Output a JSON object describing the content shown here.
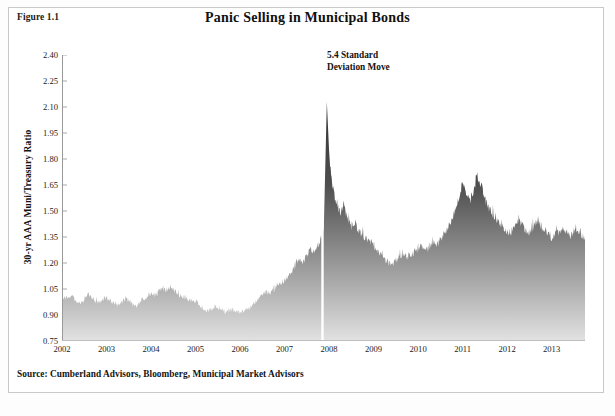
{
  "figure": {
    "label": "Figure 1.1",
    "title": "Panic Selling in Municipal Bonds",
    "source": "Source: Cumberland Advisors, Bloomberg, Municipal Market Advisors"
  },
  "annotation": {
    "line1": "5.4 Standard",
    "line2": "Deviation Move"
  },
  "axes": {
    "ylabel": "30-yr AAA Muni/Treasury Ratio",
    "yticks": [
      "2.40",
      "2.25",
      "2.10",
      "1.95",
      "1.80",
      "1.65",
      "1.50",
      "1.35",
      "1.20",
      "1.05",
      "0.90",
      "0.75"
    ],
    "xticks": [
      "2002",
      "2003",
      "2004",
      "2005",
      "2006",
      "2007",
      "2008",
      "2009",
      "2010",
      "2011",
      "2012",
      "2013"
    ]
  },
  "colors": {
    "fill_top": "#3a3a3a",
    "fill_bottom": "#d8d8d8",
    "axis": "#9a9a9a",
    "text": "#141414",
    "frame": "#c9c9c9",
    "gap_line": "#ffffff"
  },
  "chart_data": {
    "type": "area",
    "title": "Panic Selling in Municipal Bonds",
    "xlabel": "",
    "ylabel": "30-yr AAA Muni/Treasury Ratio",
    "xlim": [
      2002.0,
      2013.75
    ],
    "ylim": [
      0.75,
      2.4
    ],
    "yticks": [
      0.75,
      0.9,
      1.05,
      1.2,
      1.35,
      1.5,
      1.65,
      1.8,
      1.95,
      2.1,
      2.25,
      2.4
    ],
    "xticks": [
      2002,
      2003,
      2004,
      2005,
      2006,
      2007,
      2008,
      2009,
      2010,
      2011,
      2012,
      2013
    ],
    "grid": false,
    "legend": null,
    "annotations": [
      {
        "text": "5.4 Standard Deviation Move",
        "x": 2008.0,
        "y": 2.3
      }
    ],
    "data_gap": {
      "x": 2007.85,
      "note": "white vertical break in series just before the peak"
    },
    "peak": {
      "x": 2007.95,
      "y": 2.13
    },
    "series": [
      {
        "name": "30-yr AAA Muni/Treasury Ratio",
        "x": [
          2002.0,
          2002.08,
          2002.17,
          2002.25,
          2002.33,
          2002.42,
          2002.5,
          2002.58,
          2002.67,
          2002.75,
          2002.83,
          2002.92,
          2003.0,
          2003.08,
          2003.17,
          2003.25,
          2003.33,
          2003.42,
          2003.5,
          2003.58,
          2003.67,
          2003.75,
          2003.83,
          2003.92,
          2004.0,
          2004.08,
          2004.17,
          2004.25,
          2004.33,
          2004.42,
          2004.5,
          2004.58,
          2004.67,
          2004.75,
          2004.83,
          2004.92,
          2005.0,
          2005.08,
          2005.17,
          2005.25,
          2005.33,
          2005.42,
          2005.5,
          2005.58,
          2005.67,
          2005.75,
          2005.83,
          2005.92,
          2006.0,
          2006.08,
          2006.17,
          2006.25,
          2006.33,
          2006.42,
          2006.5,
          2006.58,
          2006.67,
          2006.75,
          2006.83,
          2006.92,
          2007.0,
          2007.08,
          2007.17,
          2007.25,
          2007.33,
          2007.42,
          2007.5,
          2007.58,
          2007.67,
          2007.75,
          2007.83,
          2007.88,
          2007.95,
          2008.0,
          2008.08,
          2008.17,
          2008.25,
          2008.33,
          2008.42,
          2008.5,
          2008.58,
          2008.67,
          2008.75,
          2008.83,
          2008.92,
          2009.0,
          2009.08,
          2009.17,
          2009.25,
          2009.33,
          2009.42,
          2009.5,
          2009.58,
          2009.67,
          2009.75,
          2009.83,
          2009.92,
          2010.0,
          2010.08,
          2010.17,
          2010.25,
          2010.33,
          2010.42,
          2010.5,
          2010.58,
          2010.67,
          2010.75,
          2010.83,
          2010.92,
          2011.0,
          2011.08,
          2011.17,
          2011.25,
          2011.33,
          2011.42,
          2011.5,
          2011.58,
          2011.67,
          2011.75,
          2011.83,
          2011.92,
          2012.0,
          2012.08,
          2012.17,
          2012.25,
          2012.33,
          2012.42,
          2012.5,
          2012.58,
          2012.67,
          2012.75,
          2012.83,
          2012.92,
          2013.0,
          2013.08,
          2013.17,
          2013.25,
          2013.33,
          2013.42,
          2013.5,
          2013.58,
          2013.67,
          2013.75
        ],
        "y": [
          0.98,
          1.0,
          0.99,
          1.01,
          0.97,
          0.96,
          0.99,
          1.02,
          1.0,
          0.98,
          0.97,
          0.99,
          1.0,
          0.98,
          0.96,
          0.95,
          0.97,
          0.99,
          0.98,
          0.96,
          0.95,
          0.97,
          0.99,
          1.0,
          1.02,
          1.01,
          1.03,
          1.05,
          1.04,
          1.06,
          1.04,
          1.02,
          1.01,
          1.0,
          0.99,
          0.98,
          0.97,
          0.95,
          0.93,
          0.92,
          0.93,
          0.94,
          0.93,
          0.92,
          0.91,
          0.92,
          0.93,
          0.92,
          0.91,
          0.92,
          0.93,
          0.95,
          0.97,
          0.99,
          1.01,
          1.03,
          1.02,
          1.04,
          1.06,
          1.08,
          1.1,
          1.12,
          1.15,
          1.18,
          1.22,
          1.2,
          1.24,
          1.28,
          1.26,
          1.3,
          1.34,
          1.38,
          2.13,
          1.85,
          1.62,
          1.55,
          1.48,
          1.52,
          1.45,
          1.4,
          1.42,
          1.38,
          1.36,
          1.34,
          1.32,
          1.3,
          1.26,
          1.24,
          1.22,
          1.2,
          1.19,
          1.21,
          1.23,
          1.25,
          1.22,
          1.24,
          1.26,
          1.28,
          1.3,
          1.27,
          1.29,
          1.32,
          1.3,
          1.33,
          1.36,
          1.4,
          1.44,
          1.5,
          1.58,
          1.66,
          1.6,
          1.55,
          1.62,
          1.7,
          1.64,
          1.56,
          1.52,
          1.48,
          1.44,
          1.42,
          1.4,
          1.38,
          1.36,
          1.4,
          1.44,
          1.42,
          1.38,
          1.36,
          1.4,
          1.43,
          1.41,
          1.38,
          1.36,
          1.34,
          1.36,
          1.38,
          1.4,
          1.37,
          1.35,
          1.38,
          1.4,
          1.36,
          1.34
        ]
      }
    ]
  }
}
